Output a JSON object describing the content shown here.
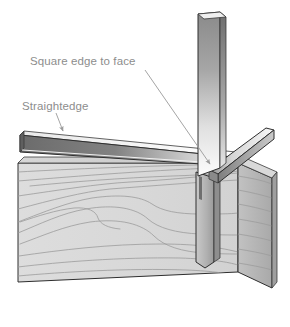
{
  "figure": {
    "background_color": "#ffffff",
    "width": 290,
    "height": 327
  },
  "labels": [
    {
      "id": "square-edge-to-face",
      "text": "Square edge to face",
      "x": 30,
      "y": 65,
      "color": "#8d8d8d",
      "leader": {
        "from_x": 145,
        "from_y": 70,
        "to_x": 212,
        "to_y": 167,
        "arrow": "down-right"
      }
    },
    {
      "id": "straightedge",
      "text": "Straightedge",
      "x": 22,
      "y": 110,
      "color": "#8d8d8d",
      "leader": {
        "from_x": 56,
        "from_y": 114,
        "to_x": 64,
        "to_y": 134,
        "arrow": "down-right"
      }
    }
  ],
  "bottom_caption": {
    "text": "",
    "visible": false
  },
  "parts": [
    {
      "id": "board",
      "name": "wooden-board",
      "description": "Long board seen in perspective with visible face, top edge and right end grain",
      "face_color": "#dcdcdc",
      "end_color": "#b9b9b9",
      "top_edge_color": "#cfcfcf",
      "grain_color": "#9c9c9c",
      "outline_color": "#2e2e2e"
    },
    {
      "id": "straightedge-bar",
      "name": "straightedge",
      "description": "Dark metal straightedge laid along the board face",
      "side_color_left": "#6f6f6f",
      "side_color_right": "#d8d8d8",
      "top_color": "#ececec",
      "outline_color": "#2e2e2e"
    },
    {
      "id": "square-blade",
      "name": "try-square-blade",
      "description": "Vertical blade of the try square rising above the board",
      "gradient_top": "#8a8a8a",
      "gradient_bottom": "#fbfbfb",
      "outline_color": "#2e2e2e"
    },
    {
      "id": "square-stock",
      "name": "try-square-stock",
      "description": "Angled arm of the square resting against the board end",
      "top_color": "#f2f2f2",
      "side_color": "#9a9a9a",
      "outline_color": "#2e2e2e"
    },
    {
      "id": "blade-on-face",
      "name": "square-blade-against-face",
      "description": "Blade portion lying flat against the board face below the joint",
      "front_color": "#bcbcbc",
      "side_color": "#8f8f8f",
      "outline_color": "#2e2e2e"
    }
  ],
  "colors": {
    "background": "#ffffff",
    "label_text": "#8d8d8d",
    "leader_line": "#9a9a9a",
    "outline": "#2e2e2e",
    "board_face": "#dcdcdc",
    "board_end": "#b9b9b9",
    "grain": "#9c9c9c",
    "metal_dark": "#6f6f6f",
    "metal_light": "#fbfbfb"
  }
}
